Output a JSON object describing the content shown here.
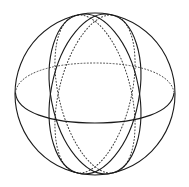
{
  "figure": {
    "canvas": {
      "width": 189,
      "height": 187,
      "background": "#ffffff"
    },
    "style": {
      "stroke_color": "#1a1a1a",
      "stroke_color_soft": "#3a3a3a",
      "stroke_width": 1.0,
      "dash_pattern": "1 2.2",
      "fill": "none"
    },
    "sphere": {
      "center_x": 95,
      "center_y": 94,
      "radius_x": 80,
      "radius_y": 81
    },
    "elements": [
      {
        "name": "sphere-outline",
        "kind": "circle",
        "visible": "solid",
        "cx": 95,
        "cy": 94,
        "rx": 80,
        "ry": 81
      },
      {
        "name": "equator-front",
        "kind": "ellipse-arc",
        "visible": "solid",
        "cx": 95,
        "cy": 99,
        "rx": 80,
        "ry": 19,
        "rotation": -1
      },
      {
        "name": "equator-back",
        "kind": "ellipse-arc",
        "visible": "dotted",
        "cx": 95,
        "cy": 84,
        "rx": 79,
        "ry": 21,
        "rotation": -1
      },
      {
        "name": "meridian-left-front",
        "kind": "ellipse",
        "visible": "solid",
        "cx": 95,
        "cy": 94,
        "rx": 44,
        "ry": 81,
        "rotation": 11
      },
      {
        "name": "meridian-right-front",
        "kind": "ellipse",
        "visible": "solid",
        "cx": 95,
        "cy": 94,
        "rx": 44,
        "ry": 81,
        "rotation": -11
      },
      {
        "name": "meridian-left-back",
        "kind": "ellipse",
        "visible": "dotted",
        "cx": 95,
        "cy": 94,
        "rx": 36,
        "ry": 81,
        "rotation": 14
      },
      {
        "name": "meridian-right-back",
        "kind": "ellipse",
        "visible": "dotted",
        "cx": 95,
        "cy": 94,
        "rx": 36,
        "ry": 81,
        "rotation": -14
      }
    ],
    "pole_top": {
      "x": 95,
      "y": 19
    },
    "pole_bottom": {
      "x": 95,
      "y": 170
    }
  }
}
